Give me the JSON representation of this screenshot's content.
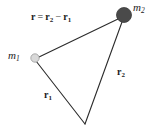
{
  "figure": {
    "type": "vector-diagram",
    "background_color": "#ffffff",
    "width": 155,
    "height": 131,
    "line_color": "#2b2b2b",
    "text_color": "#1c1c1c"
  },
  "masses": [
    {
      "id": "m1",
      "label": "m",
      "subscript": "1",
      "cx": 35,
      "cy": 58,
      "r": 4.2,
      "fill_color": "#d9d9d9",
      "stroke_color": "#9a9a9a"
    },
    {
      "id": "m2",
      "label": "m",
      "subscript": "2",
      "cx": 124,
      "cy": 15,
      "r": 7.5,
      "fill_color": "#4a4a4a",
      "stroke_color": "#3a3a3a"
    }
  ],
  "origin": {
    "id": "origin",
    "x": 85,
    "y": 124
  },
  "vectors": [
    {
      "id": "r",
      "label": "r",
      "subscript": "",
      "from": "m1",
      "to": "m2",
      "x1": 39,
      "y1": 57,
      "x2": 118,
      "y2": 19
    },
    {
      "id": "r1",
      "label": "r",
      "subscript": "1",
      "from": "origin",
      "to": "m1",
      "x1": 85,
      "y1": 124,
      "x2": 36,
      "y2": 61
    },
    {
      "id": "r2",
      "label": "r",
      "subscript": "2",
      "from": "origin",
      "to": "m2",
      "x1": 85,
      "y1": 124,
      "x2": 122,
      "y2": 22
    }
  ],
  "equation": {
    "lhs": "r",
    "equals": "=",
    "term1": "r",
    "term1_sub": "2",
    "operator": "−",
    "term2": "r",
    "term2_sub": "1",
    "full_text": "r = r2 − r1"
  }
}
